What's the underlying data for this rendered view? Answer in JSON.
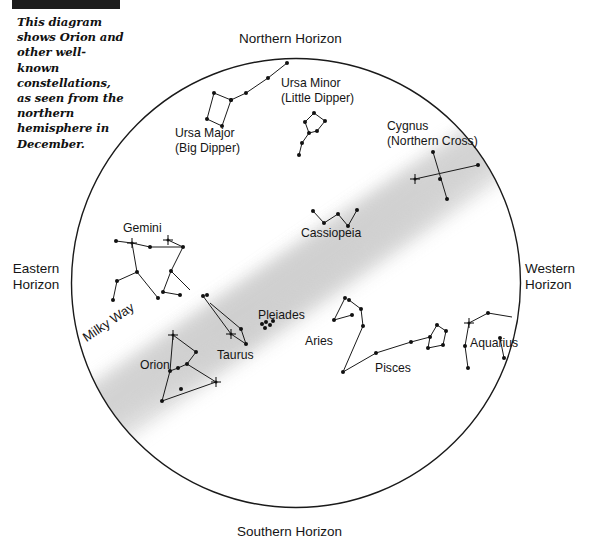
{
  "figure": {
    "header_bar_label": "",
    "caption": "This diagram shows Orion and other well-known constellations, as seen from the northern hemisphere in December."
  },
  "colors": {
    "ink": "#151515",
    "circle_stroke": "#1a1a1a",
    "milky_way": "#d7d7d7",
    "header_bar": "#1c1c1c",
    "background": "#ffffff"
  },
  "sky_chart": {
    "type": "star-chart",
    "projection": "circular horizon dome, northern hemisphere, December",
    "circle": {
      "cx": 296,
      "cy": 283,
      "r": 225
    },
    "horizons": {
      "north": "Northern Horizon",
      "south": "Southern Horizon",
      "east": "Eastern\nHorizon",
      "east_line1": "Eastern",
      "east_line2": "Horizon",
      "west_line1": "Western",
      "west_line2": "Horizon"
    },
    "milky_way": {
      "label": "Milky Way",
      "description": "diffuse grey band running from lower-left (southwest) to upper-right (northeast)"
    },
    "constellations": [
      {
        "name": "Ursa Major",
        "alt_name": "(Big Dipper)",
        "label_x": 175,
        "label_y": 126,
        "stars": [
          {
            "x": 287,
            "y": 63,
            "bright": false
          },
          {
            "x": 268,
            "y": 78,
            "bright": false
          },
          {
            "x": 246,
            "y": 93,
            "bright": false
          },
          {
            "x": 231,
            "y": 100,
            "bright": false
          },
          {
            "x": 214,
            "y": 93,
            "bright": false
          },
          {
            "x": 207,
            "y": 119,
            "bright": false
          },
          {
            "x": 222,
            "y": 126,
            "bright": false
          },
          {
            "x": 231,
            "y": 100,
            "bright": false
          }
        ],
        "lines": [
          [
            287,
            63,
            268,
            78
          ],
          [
            268,
            78,
            246,
            93
          ],
          [
            246,
            93,
            231,
            100
          ],
          [
            231,
            100,
            214,
            93
          ],
          [
            214,
            93,
            207,
            119
          ],
          [
            207,
            119,
            222,
            126
          ],
          [
            222,
            126,
            231,
            100
          ]
        ]
      },
      {
        "name": "Ursa Minor",
        "alt_name": "(Little Dipper)",
        "label_x": 281,
        "label_y": 76,
        "stars": [
          {
            "x": 299,
            "y": 155,
            "bright": false
          },
          {
            "x": 302,
            "y": 143,
            "bright": false
          },
          {
            "x": 309,
            "y": 133,
            "bright": false
          },
          {
            "x": 305,
            "y": 122,
            "bright": false
          },
          {
            "x": 314,
            "y": 113,
            "bright": false
          },
          {
            "x": 325,
            "y": 121,
            "bright": false
          },
          {
            "x": 317,
            "y": 131,
            "bright": false
          }
        ],
        "lines": [
          [
            299,
            155,
            302,
            143
          ],
          [
            302,
            143,
            309,
            133
          ],
          [
            309,
            133,
            305,
            122
          ],
          [
            305,
            122,
            314,
            113
          ],
          [
            314,
            113,
            325,
            121
          ],
          [
            325,
            121,
            317,
            131
          ],
          [
            317,
            131,
            309,
            133
          ]
        ]
      },
      {
        "name": "Cygnus",
        "alt_name": "(Northern Cross)",
        "label_x": 387,
        "label_y": 119,
        "stars": [
          {
            "x": 433,
            "y": 152,
            "bright": false
          },
          {
            "x": 440,
            "y": 179,
            "bright": false
          },
          {
            "x": 447,
            "y": 199,
            "bright": false
          },
          {
            "x": 415,
            "y": 179,
            "bright": true
          },
          {
            "x": 478,
            "y": 165,
            "bright": false
          }
        ],
        "lines": [
          [
            433,
            152,
            447,
            199
          ],
          [
            415,
            179,
            478,
            165
          ]
        ]
      },
      {
        "name": "Cassiopeia",
        "alt_name": "",
        "label_x": 301,
        "label_y": 226,
        "stars": [
          {
            "x": 313,
            "y": 211,
            "bright": false
          },
          {
            "x": 324,
            "y": 223,
            "bright": false
          },
          {
            "x": 338,
            "y": 214,
            "bright": false
          },
          {
            "x": 348,
            "y": 226,
            "bright": false
          },
          {
            "x": 357,
            "y": 210,
            "bright": false
          }
        ],
        "lines": [
          [
            313,
            211,
            324,
            223
          ],
          [
            324,
            223,
            338,
            214
          ],
          [
            338,
            214,
            348,
            226
          ],
          [
            348,
            226,
            357,
            210
          ]
        ]
      },
      {
        "name": "Gemini",
        "alt_name": "",
        "label_x": 123,
        "label_y": 221,
        "stars": [
          {
            "x": 132,
            "y": 243,
            "bright": true
          },
          {
            "x": 168,
            "y": 240,
            "bright": true
          },
          {
            "x": 116,
            "y": 241,
            "bright": false
          },
          {
            "x": 150,
            "y": 247,
            "bright": false
          },
          {
            "x": 183,
            "y": 247,
            "bright": false
          },
          {
            "x": 137,
            "y": 272,
            "bright": false
          },
          {
            "x": 171,
            "y": 271,
            "bright": false
          },
          {
            "x": 117,
            "y": 281,
            "bright": false
          },
          {
            "x": 113,
            "y": 300,
            "bright": false
          },
          {
            "x": 158,
            "y": 298,
            "bright": false
          },
          {
            "x": 163,
            "y": 292,
            "bright": false
          },
          {
            "x": 180,
            "y": 295,
            "bright": false
          },
          {
            "x": 207,
            "y": 295,
            "bright": false
          }
        ],
        "lines": [
          [
            116,
            241,
            132,
            243
          ],
          [
            132,
            243,
            150,
            247
          ],
          [
            150,
            247,
            183,
            247
          ],
          [
            168,
            240,
            183,
            247
          ],
          [
            132,
            243,
            137,
            272
          ],
          [
            137,
            272,
            117,
            281
          ],
          [
            117,
            281,
            113,
            300
          ],
          [
            137,
            272,
            158,
            298
          ],
          [
            183,
            247,
            171,
            271
          ],
          [
            171,
            271,
            163,
            292
          ],
          [
            163,
            292,
            180,
            295
          ],
          [
            171,
            271,
            190,
            290
          ]
        ]
      },
      {
        "name": "Orion",
        "alt_name": "",
        "label_x": 140,
        "label_y": 358,
        "stars": [
          {
            "x": 173,
            "y": 335,
            "bright": true
          },
          {
            "x": 216,
            "y": 382,
            "bright": true
          },
          {
            "x": 196,
            "y": 352,
            "bright": false
          },
          {
            "x": 187,
            "y": 364,
            "bright": false
          },
          {
            "x": 178,
            "y": 368,
            "bright": false
          },
          {
            "x": 170,
            "y": 371,
            "bright": false
          },
          {
            "x": 181,
            "y": 389,
            "bright": false
          },
          {
            "x": 162,
            "y": 401,
            "bright": false
          }
        ],
        "lines": [
          [
            173,
            335,
            196,
            352
          ],
          [
            196,
            352,
            187,
            364
          ],
          [
            187,
            364,
            216,
            382
          ],
          [
            173,
            335,
            170,
            371
          ],
          [
            170,
            371,
            178,
            368
          ],
          [
            178,
            368,
            187,
            364
          ],
          [
            170,
            371,
            162,
            401
          ],
          [
            162,
            401,
            216,
            382
          ]
        ]
      },
      {
        "name": "Taurus",
        "alt_name": "",
        "label_x": 217,
        "label_y": 348,
        "stars": [
          {
            "x": 231,
            "y": 334,
            "bright": true
          },
          {
            "x": 203,
            "y": 296,
            "bright": false
          },
          {
            "x": 246,
            "y": 344,
            "bright": false
          },
          {
            "x": 241,
            "y": 329,
            "bright": false
          }
        ],
        "lines": [
          [
            203,
            296,
            231,
            334
          ],
          [
            231,
            334,
            246,
            344
          ],
          [
            210,
            303,
            241,
            329
          ],
          [
            241,
            329,
            246,
            344
          ]
        ]
      },
      {
        "name": "Pleiades",
        "alt_name": "",
        "label_x": 258,
        "label_y": 308,
        "stars": [
          {
            "x": 262,
            "y": 324,
            "bright": false
          },
          {
            "x": 266,
            "y": 322,
            "bright": false
          },
          {
            "x": 270,
            "y": 325,
            "bright": false
          },
          {
            "x": 265,
            "y": 328,
            "bright": false
          },
          {
            "x": 273,
            "y": 321,
            "bright": false
          }
        ],
        "lines": []
      },
      {
        "name": "Aries",
        "alt_name": "",
        "label_x": 305,
        "label_y": 334,
        "stars": [
          {
            "x": 345,
            "y": 298,
            "bright": false
          },
          {
            "x": 334,
            "y": 320,
            "bright": false
          },
          {
            "x": 352,
            "y": 315,
            "bright": false
          }
        ],
        "lines": [
          [
            345,
            298,
            334,
            320
          ],
          [
            334,
            320,
            352,
            315
          ]
        ]
      },
      {
        "name": "Pisces",
        "alt_name": "",
        "label_x": 375,
        "label_y": 361,
        "stars": [
          {
            "x": 349,
            "y": 300,
            "bright": false
          },
          {
            "x": 361,
            "y": 309,
            "bright": false
          },
          {
            "x": 363,
            "y": 326,
            "bright": false
          },
          {
            "x": 343,
            "y": 372,
            "bright": false
          },
          {
            "x": 376,
            "y": 353,
            "bright": false
          },
          {
            "x": 411,
            "y": 342,
            "bright": false
          },
          {
            "x": 430,
            "y": 337,
            "bright": false
          },
          {
            "x": 437,
            "y": 325,
            "bright": false
          },
          {
            "x": 446,
            "y": 331,
            "bright": false
          },
          {
            "x": 443,
            "y": 345,
            "bright": false
          },
          {
            "x": 428,
            "y": 348,
            "bright": false
          }
        ],
        "lines": [
          [
            349,
            300,
            361,
            309
          ],
          [
            361,
            309,
            363,
            326
          ],
          [
            363,
            326,
            343,
            372
          ],
          [
            343,
            372,
            376,
            353
          ],
          [
            376,
            353,
            411,
            342
          ],
          [
            411,
            342,
            430,
            337
          ],
          [
            430,
            337,
            437,
            325
          ],
          [
            437,
            325,
            446,
            331
          ],
          [
            446,
            331,
            443,
            345
          ],
          [
            443,
            345,
            428,
            348
          ],
          [
            428,
            348,
            430,
            337
          ]
        ]
      },
      {
        "name": "Aquarius",
        "alt_name": "",
        "label_x": 470,
        "label_y": 336,
        "stars": [
          {
            "x": 469,
            "y": 323,
            "bright": true
          },
          {
            "x": 488,
            "y": 313,
            "bright": false
          },
          {
            "x": 465,
            "y": 346,
            "bright": false
          },
          {
            "x": 468,
            "y": 368,
            "bright": false
          },
          {
            "x": 500,
            "y": 338,
            "bright": false
          },
          {
            "x": 504,
            "y": 358,
            "bright": false
          }
        ],
        "lines": [
          [
            469,
            323,
            488,
            313
          ],
          [
            488,
            313,
            512,
            317
          ],
          [
            469,
            323,
            465,
            346
          ],
          [
            465,
            346,
            468,
            368
          ],
          [
            500,
            338,
            504,
            358
          ]
        ]
      }
    ]
  }
}
